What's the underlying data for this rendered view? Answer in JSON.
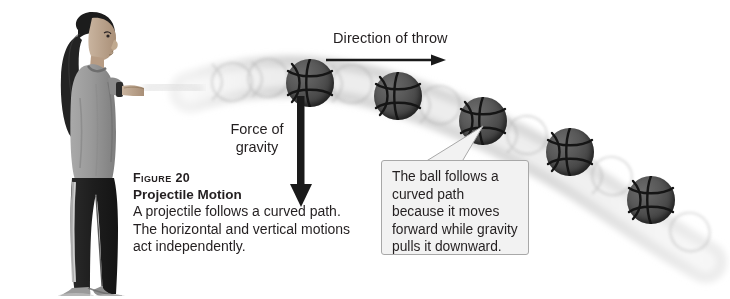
{
  "figure": {
    "number_label": "Figure 20",
    "title": "Projectile Motion",
    "description": "A projectile follows a curved path. The horizontal and vertical motions act independently."
  },
  "annotations": {
    "throw_direction_label": "Direction of throw",
    "gravity_label": "Force of\ngravity",
    "gravity_label_line1": "Force of",
    "gravity_label_line2": "gravity"
  },
  "callout": {
    "text": "The ball follows a curved path because it moves forward while gravity pulls it downward."
  },
  "colors": {
    "text": "#231f20",
    "callout_fill": "#f2f2f2",
    "callout_border": "#a8a8a8",
    "ball_fill": "#4a4a4a",
    "ball_seam": "#1a1a1a",
    "arrow": "#1a1a1a",
    "trajectory_band": "#d9d9d9",
    "background": "#ffffff"
  },
  "scene": {
    "subject": "girl-throwing-ball-photo",
    "balls": [
      {
        "name": "ball-1",
        "cx": 310,
        "cy": 83,
        "r": 24
      },
      {
        "name": "ball-2",
        "cx": 398,
        "cy": 96,
        "r": 24
      },
      {
        "name": "ball-3",
        "cx": 483,
        "cy": 121,
        "r": 24
      },
      {
        "name": "ball-4",
        "cx": 570,
        "cy": 152,
        "r": 24
      },
      {
        "name": "ball-5",
        "cx": 651,
        "cy": 200,
        "r": 24
      }
    ],
    "trajectory_path": "M 196,92 C 260,74 330,74 400,96 C 470,118 540,152 600,190 C 640,215 670,238 700,258"
  }
}
